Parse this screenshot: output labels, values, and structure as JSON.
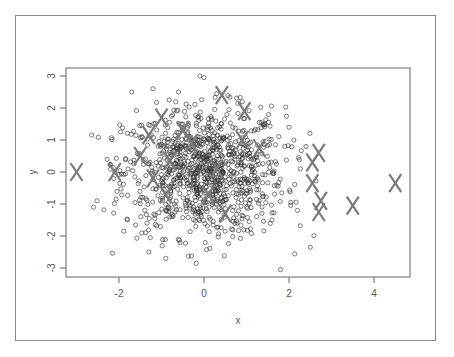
{
  "chart_data": {
    "type": "scatter",
    "title": "",
    "xlabel": "x",
    "ylabel": "y",
    "xlim": [
      -3.25,
      4.85
    ],
    "ylim": [
      -3.25,
      3.25
    ],
    "xticks": [
      -2,
      0,
      2,
      4
    ],
    "yticks": [
      -3,
      -2,
      -1,
      0,
      1,
      2,
      3
    ],
    "xtick_labels": [
      "-2",
      "0",
      "2",
      "4"
    ],
    "ytick_labels": [
      "-3",
      "-2",
      "-1",
      "0",
      "1",
      "2",
      "3"
    ],
    "grid": false,
    "legend": null,
    "series": [
      {
        "name": "sample points",
        "marker": "open-circle",
        "color": "#333333",
        "distribution": "bivariate standard normal, n≈1000, centered at (0,0)",
        "n": 1000,
        "notable_points": [
          {
            "x": -2.6,
            "y": -1.1
          },
          {
            "x": -2.1,
            "y": 0.0
          },
          {
            "x": -1.7,
            "y": 2.5
          },
          {
            "x": -1.2,
            "y": 2.6
          },
          {
            "x": -1.3,
            "y": -2.5
          },
          {
            "x": -0.9,
            "y": -2.7
          },
          {
            "x": -0.1,
            "y": 3.0
          },
          {
            "x": 0.0,
            "y": 2.95
          },
          {
            "x": 1.8,
            "y": -3.05
          },
          {
            "x": 2.5,
            "y": -2.35
          },
          {
            "x": 1.3,
            "y": 1.55
          },
          {
            "x": 1.9,
            "y": 0.8
          },
          {
            "x": 2.0,
            "y": 1.4
          },
          {
            "x": 2.2,
            "y": -1.2
          },
          {
            "x": 1.6,
            "y": -1.5
          }
        ]
      },
      {
        "name": "highlighted points",
        "marker": "X",
        "color": "#777777",
        "points": [
          {
            "x": -3.0,
            "y": 0.0
          },
          {
            "x": -2.1,
            "y": 0.0
          },
          {
            "x": -1.0,
            "y": 1.7
          },
          {
            "x": 0.42,
            "y": 2.4
          },
          {
            "x": 0.95,
            "y": 1.9
          },
          {
            "x": -1.3,
            "y": 1.15
          },
          {
            "x": -0.5,
            "y": 1.3
          },
          {
            "x": -1.5,
            "y": 0.5
          },
          {
            "x": -0.8,
            "y": 0.35
          },
          {
            "x": -1.2,
            "y": -0.2
          },
          {
            "x": -0.3,
            "y": 0.9
          },
          {
            "x": 0.3,
            "y": 0.1
          },
          {
            "x": 0.5,
            "y": -1.3
          },
          {
            "x": 1.3,
            "y": 0.75
          },
          {
            "x": 0.9,
            "y": 1.0
          },
          {
            "x": -0.9,
            "y": -0.7
          },
          {
            "x": 0.1,
            "y": -0.7
          },
          {
            "x": 2.55,
            "y": 0.3
          },
          {
            "x": 2.7,
            "y": 0.6
          },
          {
            "x": 2.55,
            "y": -0.35
          },
          {
            "x": 2.75,
            "y": -0.9
          },
          {
            "x": 2.7,
            "y": -1.25
          },
          {
            "x": 3.5,
            "y": -1.05
          },
          {
            "x": 4.5,
            "y": -0.35
          }
        ]
      }
    ]
  },
  "layout": {
    "plot_box": {
      "left": 66,
      "top": 68,
      "right": 410,
      "bottom": 277
    },
    "x_origin_px": 204,
    "x_unit_px": 42.5,
    "y_origin_px": 172,
    "y_unit_px": 32,
    "axis_color": "#666666",
    "circle_color": "#333333",
    "x_marker_color": "#7a7a7a"
  }
}
